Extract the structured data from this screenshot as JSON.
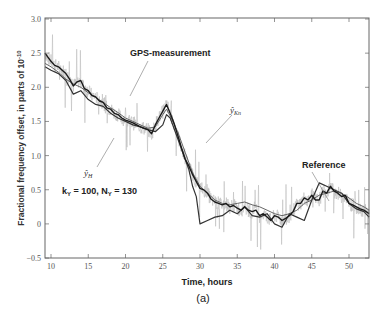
{
  "chart_data": {
    "type": "line",
    "title": "",
    "caption": "(a)",
    "xlabel": "Time, hours",
    "ylabel": "Fractional frequency offset, in parts of 10",
    "ylabel_exponent": "-10",
    "xlim": [
      9.2,
      52.7
    ],
    "ylim": [
      -0.5,
      3.0
    ],
    "xticks": [
      10,
      15,
      20,
      25,
      30,
      35,
      40,
      45,
      50
    ],
    "yticks": [
      -0.5,
      0,
      0.5,
      1.0,
      1.5,
      2.0,
      2.5,
      3.0
    ],
    "ytick_labels": [
      "−0.5",
      "0",
      "0.5",
      "1.0",
      "1.5",
      "2.0",
      "2.5",
      "3.0"
    ],
    "grid": false,
    "annotations": [
      {
        "text": "GPS-measurement",
        "x": 20.2,
        "y": 2.38,
        "arrow_to": [
          18.7,
          1.92
        ]
      },
      {
        "text": "ŷ",
        "subscript": "Kn",
        "x": 29.5,
        "y": 1.62,
        "arrow_to": [
          26.8,
          1.25
        ]
      },
      {
        "text": "ŷ",
        "subscript": "H",
        "x": 15.1,
        "y": 0.88,
        "arrow_to": [
          19.2,
          1.38
        ]
      },
      {
        "text": "Reference",
        "x": 46.0,
        "y": 1.02,
        "arrow_to": [
          46.8,
          0.5
        ]
      },
      {
        "text": "k",
        "subscript": "Y",
        "suffix": " = 100, N",
        "suffix_sub": "Y",
        "tail": " = 130",
        "x": 11.0,
        "y": 0.62
      }
    ],
    "series": [
      {
        "name": "Reference",
        "color": "#1a1a1a",
        "width": 1.4,
        "x": [
          9.2,
          10,
          10.5,
          11,
          11.5,
          12,
          12.5,
          13,
          13.5,
          14,
          14.5,
          15,
          15.5,
          16,
          16.5,
          17,
          17.5,
          18,
          18.5,
          19,
          19.5,
          20,
          20.5,
          21,
          21.5,
          22,
          22.5,
          23,
          23.5,
          24,
          24.5,
          25,
          25.5,
          26,
          26.5,
          27,
          27.5,
          28,
          28.5,
          29,
          29.5,
          30,
          30.5,
          31,
          31.5,
          32,
          32.5,
          33,
          33.5,
          34,
          34.5,
          35,
          35.5,
          36,
          36.5,
          37,
          37.5,
          38,
          38.5,
          39,
          39.5,
          40,
          40.5,
          41,
          41.5,
          42,
          42.5,
          43,
          43.5,
          44,
          44.5,
          45,
          45.5,
          46,
          46.5,
          47,
          47.5,
          48,
          48.5,
          49,
          49.5,
          50,
          50.5,
          51,
          51.5,
          52,
          52.7
        ],
        "y": [
          2.5,
          2.38,
          2.32,
          2.3,
          2.25,
          2.2,
          2.12,
          2.02,
          2.08,
          2.1,
          1.98,
          1.95,
          1.88,
          1.86,
          1.8,
          1.78,
          1.7,
          1.68,
          1.62,
          1.6,
          1.55,
          1.52,
          1.5,
          1.48,
          1.45,
          1.42,
          1.4,
          1.38,
          1.32,
          1.45,
          1.55,
          1.65,
          1.75,
          1.62,
          1.48,
          1.3,
          1.12,
          0.95,
          0.85,
          0.72,
          0.62,
          0.52,
          0.5,
          0.45,
          0.36,
          0.32,
          0.3,
          0.28,
          0.3,
          0.25,
          0.27,
          0.23,
          0.2,
          0.25,
          0.2,
          0.18,
          0.2,
          0.12,
          0.15,
          0.1,
          0.05,
          0.12,
          0.1,
          0.05,
          0.08,
          0.12,
          0.18,
          0.3,
          0.3,
          0.38,
          0.35,
          0.42,
          0.35,
          0.35,
          0.48,
          0.45,
          0.55,
          0.48,
          0.45,
          0.4,
          0.42,
          0.3,
          0.28,
          0.25,
          0.22,
          0.2,
          0.15
        ]
      },
      {
        "name": "ŷ_Kn",
        "color": "#555555",
        "width": 0.9,
        "x": [
          9.2,
          10,
          11,
          12,
          13,
          14,
          15,
          16,
          17,
          18,
          19,
          20,
          21,
          22,
          23,
          24,
          25,
          25.5,
          26,
          27,
          28,
          29,
          30,
          31,
          32,
          33,
          34,
          35,
          36,
          37,
          38,
          39,
          40,
          41,
          42,
          43,
          44,
          45,
          46,
          47,
          48,
          49,
          50,
          51,
          52,
          52.7
        ],
        "y": [
          2.35,
          2.3,
          2.22,
          2.12,
          2.05,
          2.0,
          1.92,
          1.85,
          1.78,
          1.7,
          1.63,
          1.55,
          1.5,
          1.45,
          1.4,
          1.42,
          1.6,
          1.68,
          1.58,
          1.35,
          1.05,
          0.75,
          0.55,
          0.45,
          0.35,
          0.3,
          0.28,
          0.3,
          0.32,
          0.28,
          0.25,
          0.2,
          0.15,
          0.12,
          0.15,
          0.2,
          0.3,
          0.35,
          0.42,
          0.45,
          0.48,
          0.45,
          0.38,
          0.3,
          0.25,
          0.2
        ]
      },
      {
        "name": "ŷ_H",
        "color": "#333333",
        "width": 1.2,
        "x": [
          9.2,
          10,
          11,
          12,
          13,
          14,
          15,
          16,
          17,
          18,
          19,
          20,
          21,
          22,
          23,
          24,
          25,
          25.5,
          26,
          27,
          28,
          28.5,
          29,
          29.5,
          30,
          31,
          32,
          33,
          34,
          35,
          36,
          37,
          38,
          39,
          40,
          41,
          42,
          43,
          44,
          45,
          46,
          47,
          48,
          49,
          50,
          51,
          52,
          52.7
        ],
        "y": [
          2.3,
          2.25,
          2.2,
          2.1,
          1.9,
          1.95,
          1.82,
          1.75,
          1.72,
          1.62,
          1.55,
          1.5,
          1.45,
          1.42,
          1.38,
          1.35,
          1.45,
          1.6,
          1.55,
          1.25,
          0.95,
          0.8,
          0.55,
          0.4,
          0.0,
          0.05,
          0.1,
          0.12,
          0.2,
          0.15,
          0.25,
          0.12,
          0.1,
          0.15,
          0.0,
          -0.05,
          0.15,
          0.1,
          0.05,
          0.35,
          0.6,
          0.55,
          0.5,
          0.45,
          0.3,
          0.22,
          0.18,
          0.1
        ]
      },
      {
        "name": "GPS-measurement",
        "color": "#bdbdbd",
        "width": 0.6,
        "noisy": true,
        "base_series": "Reference",
        "amplitude": 0.35
      }
    ]
  }
}
